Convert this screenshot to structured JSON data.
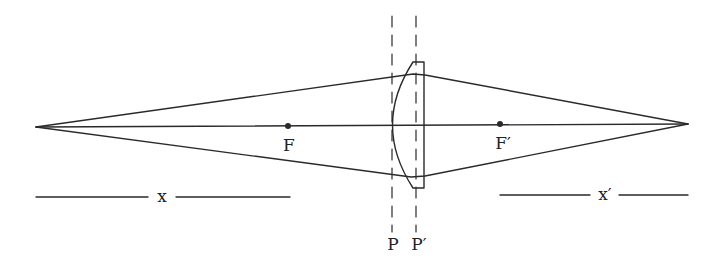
{
  "diagram": {
    "type": "thick lens (plano-convex) optical ray diagram",
    "colors": {
      "stroke": "#2a2a2a",
      "background": "#ffffff"
    },
    "labels": {
      "focal_front": "F",
      "focal_back": "F′",
      "principal_front": "P",
      "principal_back": "P′",
      "object_distance": "x",
      "image_distance": "x′"
    },
    "points": {
      "object": [
        36,
        127
      ],
      "image": [
        688,
        124
      ],
      "F": [
        288,
        126
      ],
      "F_prime": [
        500,
        124
      ]
    }
  }
}
